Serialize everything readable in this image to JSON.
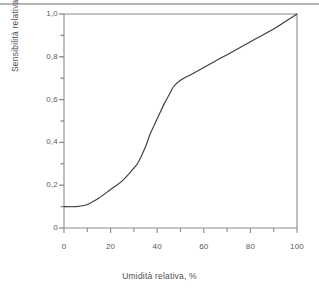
{
  "chart_data": {
    "type": "line",
    "title": "",
    "subtitle": "",
    "xlabel": "Umidità relativa, %",
    "ylabel": "Sensibilità relativa",
    "xlim": [
      0,
      100
    ],
    "ylim": [
      0,
      1.0
    ],
    "grid": false,
    "legend": null,
    "legend_position": "none",
    "x_major_ticks": [
      0,
      20,
      40,
      60,
      80,
      100
    ],
    "x_major_tick_labels": [
      "0",
      "20",
      "40",
      "60",
      "80",
      "100"
    ],
    "x_minor_ticks": [
      10,
      30,
      50,
      70,
      90
    ],
    "y_major_ticks": [
      0,
      0.2,
      0.4,
      0.6,
      0.8,
      1.0
    ],
    "y_major_tick_labels": [
      "0",
      "0,2",
      "0,4",
      "0,6",
      "0,8",
      "1,0"
    ],
    "y_minor_ticks": [
      0.1,
      0.3,
      0.5,
      0.7,
      0.9
    ],
    "series": [
      {
        "name": "Sensibilità relativa",
        "color": "#3c3c3c",
        "x": [
          0,
          5,
          10,
          15,
          20,
          25,
          30,
          32,
          35,
          37,
          40,
          43,
          45,
          47,
          50,
          55,
          60,
          65,
          70,
          75,
          80,
          85,
          90,
          95,
          100
        ],
        "values": [
          0.1,
          0.1,
          0.11,
          0.14,
          0.18,
          0.22,
          0.28,
          0.31,
          0.38,
          0.44,
          0.51,
          0.58,
          0.62,
          0.66,
          0.69,
          0.72,
          0.75,
          0.78,
          0.81,
          0.84,
          0.87,
          0.9,
          0.93,
          0.965,
          1.0
        ]
      }
    ],
    "annotations": []
  },
  "figure": {
    "background_color": "#ffffff",
    "axis_color": "#8a8a8a",
    "curve_color": "#3c3c3c",
    "frame_top_visible": true,
    "frame_right_visible": true
  }
}
